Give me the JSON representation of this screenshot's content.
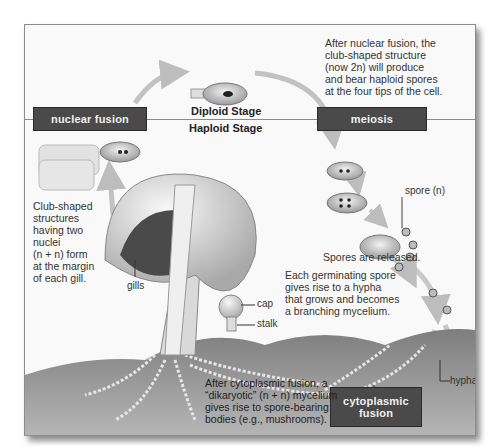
{
  "diagram": {
    "stages": {
      "diploid": "Diploid Stage",
      "haploid": "Haploid Stage"
    },
    "process_boxes": {
      "nuclear_fusion": "nuclear fusion",
      "meiosis": "meiosis",
      "cytoplasmic_fusion_line1": "cytoplasmic",
      "cytoplasmic_fusion_line2": "fusion"
    },
    "captions": {
      "meiosis_note": [
        "After nuclear fusion, the",
        "club-shaped structure",
        "(now 2n) will produce",
        "and bear haploid spores",
        "at the four tips of the cell."
      ],
      "club_note": [
        "Club-shaped",
        "structures",
        "having two",
        "nuclei",
        "(n + n) form",
        "at the margin",
        "of each gill."
      ],
      "spores_released": "Spores are released.",
      "germination_note": [
        "Each germinating spore",
        "gives rise to a hypha",
        "that grows and becomes",
        "a  branching mycelium."
      ],
      "dikaryotic_note": [
        "After cytoplasmic fusion, a",
        "“dikaryotic” (n + n) mycelium",
        "gives rise to spore-bearing",
        "bodies (e.g., mushrooms)."
      ]
    },
    "labels": {
      "gills": "gills",
      "cap": "cap",
      "stalk": "stalk",
      "spore": "spore (n)",
      "hypha": "hypha"
    },
    "colors": {
      "box_fill": "#4a4a4a",
      "box_text": "#f0f0f0",
      "arrow": "#bdbdbd",
      "soil": "#8f8f8f",
      "background": "#f9f9f9"
    }
  }
}
